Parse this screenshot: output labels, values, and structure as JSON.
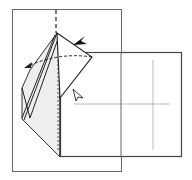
{
  "diagram": {
    "type": "origami-instruction-step",
    "colors": {
      "line": "#555555",
      "light_line": "#aaaaaa",
      "shade": "#eeeeee",
      "background": "#ffffff",
      "arrow_fill": "#111111"
    },
    "elements": {
      "back_square": {
        "x": 12,
        "y": 9,
        "w": 109,
        "h": 162
      },
      "front_square": {
        "x": 60,
        "y": 52,
        "w": 122,
        "h": 105
      },
      "fold_line_dashed": {
        "x": 56,
        "y1": 10,
        "y2": 34
      },
      "apex": {
        "x": 57,
        "y": 33
      },
      "push_arrow": {
        "x": 80,
        "y": 40,
        "style": "filled"
      },
      "open_arrow": {
        "x": 78,
        "y": 95,
        "style": "hollow"
      },
      "swing_arrow": {
        "from": [
          92,
          57
        ],
        "to": [
          26,
          66
        ]
      }
    },
    "labels": []
  }
}
